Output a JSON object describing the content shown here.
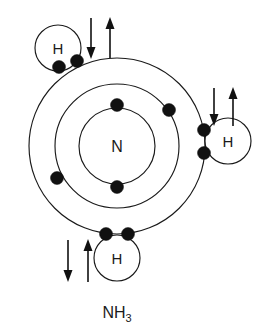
{
  "diagram": {
    "type": "bohr-shell-diagram",
    "title": "",
    "formula": {
      "base": "NH",
      "subscript": "3",
      "full": "NH3"
    },
    "center_atom": {
      "label": "N",
      "name": "nitrogen",
      "cx": 117,
      "cy": 146,
      "r": 38
    },
    "shells": [
      {
        "name": "inner-shell",
        "index": 1,
        "cx": 117,
        "cy": 146,
        "r": 62,
        "electron_count": 2
      },
      {
        "name": "outer-shell",
        "index": 2,
        "cx": 117,
        "cy": 146,
        "r": 88,
        "electron_count": 8
      }
    ],
    "hydrogens": [
      {
        "label": "H",
        "name": "hydrogen-top-left",
        "cx": 58,
        "cy": 48,
        "r": 23,
        "electron_pair_count": 2,
        "arrows": {
          "down": true,
          "up": true
        }
      },
      {
        "label": "H",
        "name": "hydrogen-right",
        "cx": 228,
        "cy": 141,
        "r": 23,
        "electron_pair_count": 2,
        "arrows": {
          "down": true,
          "up": true
        }
      },
      {
        "label": "H",
        "name": "hydrogen-bottom",
        "cx": 117,
        "cy": 258,
        "r": 23,
        "electron_pair_count": 2,
        "arrows": {
          "down": true,
          "up": true
        }
      }
    ],
    "inner_shell_electrons": [
      {
        "cx": 117,
        "cy": 105
      },
      {
        "cx": 117,
        "cy": 187
      }
    ],
    "outer_shell_electrons": [
      {
        "cx": 169,
        "cy": 110,
        "name": "outer-electron-upper-right"
      },
      {
        "cx": 57,
        "cy": 178,
        "name": "outer-electron-lower-left"
      },
      {
        "cx": 59,
        "cy": 66,
        "name": "bond-electron-top-left-a"
      },
      {
        "cx": 76,
        "cy": 61,
        "name": "bond-electron-top-left-b"
      },
      {
        "cx": 203,
        "cy": 131,
        "name": "bond-electron-right-a"
      },
      {
        "cx": 203,
        "cy": 154,
        "name": "bond-electron-right-b"
      },
      {
        "cx": 106,
        "cy": 234,
        "name": "bond-electron-bottom-a"
      },
      {
        "cx": 128,
        "cy": 234,
        "name": "bond-electron-bottom-b"
      }
    ],
    "spin_arrow_groups": [
      {
        "name": "spin-arrows-top",
        "down_x": 91,
        "up_x": 110,
        "y_top": 18,
        "y_bottom": 58
      },
      {
        "name": "spin-arrows-right",
        "down_x": 214,
        "up_x": 233,
        "y_top": 88,
        "y_bottom": 126
      },
      {
        "name": "spin-arrows-bottom",
        "down_x": 68,
        "up_x": 88,
        "y_top": 240,
        "y_bottom": 282
      }
    ],
    "colors": {
      "stroke": "#1a1a1a",
      "electron": "#111111",
      "background": "#ffffff"
    }
  }
}
